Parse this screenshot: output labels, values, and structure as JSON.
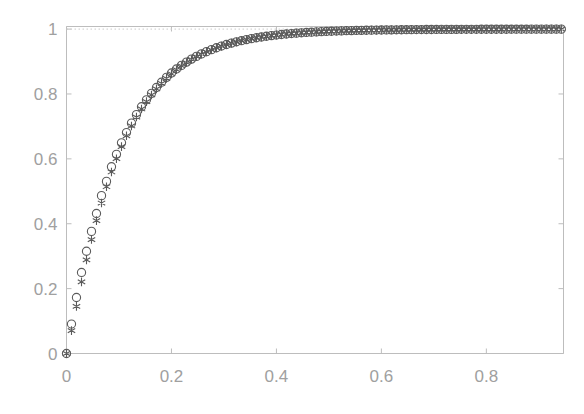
{
  "figure": {
    "background_color": "#ffffff",
    "axis_color": "#bdbdbd",
    "tick_label_color": "#a0a0a0",
    "marker_color": "#5a5a5a",
    "reference_line_color": "#cccccc"
  },
  "chart_data": {
    "type": "scatter",
    "title": "",
    "xlabel": "",
    "ylabel": "",
    "xlim": [
      0,
      0.947
    ],
    "ylim": [
      0,
      1.008
    ],
    "grid": false,
    "legend": "none",
    "xticks": [
      0,
      0.2,
      0.4,
      0.6,
      0.8
    ],
    "xtick_labels": [
      "0",
      "0.2",
      "0.4",
      "0.6",
      "0.8"
    ],
    "yticks": [
      0,
      0.2,
      0.4,
      0.6,
      0.8,
      1
    ],
    "ytick_labels": [
      "0",
      "0.2",
      "0.4",
      "0.6",
      "0.8",
      "1"
    ],
    "annotations": [
      {
        "name": "asymptote-reference-line",
        "type": "hline",
        "y": 1.0,
        "style": "dotted",
        "color": "#cccccc"
      }
    ],
    "series": [
      {
        "name": "series-circle",
        "marker": "o",
        "color": "#5a5a5a",
        "x": [
          0,
          0.0095,
          0.019,
          0.0286,
          0.0381,
          0.0476,
          0.0571,
          0.0667,
          0.0762,
          0.0857,
          0.0952,
          0.1048,
          0.1143,
          0.1238,
          0.1333,
          0.1429,
          0.1524,
          0.1619,
          0.1714,
          0.181,
          0.1905,
          0.2,
          0.2095,
          0.219,
          0.2286,
          0.2381,
          0.2476,
          0.2571,
          0.2667,
          0.2762,
          0.2857,
          0.2952,
          0.3048,
          0.3143,
          0.3238,
          0.3333,
          0.3429,
          0.3524,
          0.3619,
          0.3714,
          0.381,
          0.3905,
          0.4,
          0.4095,
          0.419,
          0.4286,
          0.4381,
          0.4476,
          0.4571,
          0.4667,
          0.4762,
          0.4857,
          0.4952,
          0.5048,
          0.5143,
          0.5238,
          0.5333,
          0.5429,
          0.5524,
          0.5619,
          0.5714,
          0.581,
          0.5905,
          0.6,
          0.6095,
          0.619,
          0.6286,
          0.6381,
          0.6476,
          0.6571,
          0.6667,
          0.6762,
          0.6857,
          0.6952,
          0.7048,
          0.7143,
          0.7238,
          0.7333,
          0.7429,
          0.7524,
          0.7619,
          0.7714,
          0.781,
          0.7905,
          0.8,
          0.8095,
          0.819,
          0.8286,
          0.8381,
          0.8476,
          0.8571,
          0.8667,
          0.8762,
          0.8857,
          0.8952,
          0.9048,
          0.9143,
          0.9238,
          0.9333,
          0.9429
        ],
        "y": [
          0,
          0.0907,
          0.1727,
          0.2498,
          0.3152,
          0.3764,
          0.4316,
          0.4866,
          0.5305,
          0.5756,
          0.6141,
          0.6493,
          0.681,
          0.7101,
          0.7363,
          0.7607,
          0.7821,
          0.8019,
          0.8199,
          0.8363,
          0.8512,
          0.8647,
          0.8771,
          0.8881,
          0.8982,
          0.9075,
          0.9159,
          0.9236,
          0.9305,
          0.9367,
          0.9425,
          0.9478,
          0.9525,
          0.9568,
          0.9608,
          0.9643,
          0.9676,
          0.9706,
          0.9733,
          0.9757,
          0.9779,
          0.9799,
          0.9817,
          0.9834,
          0.9849,
          0.9862,
          0.9875,
          0.9886,
          0.9896,
          0.9905,
          0.9913,
          0.9921,
          0.9928,
          0.9934,
          0.994,
          0.9945,
          0.995,
          0.9954,
          0.9958,
          0.9961,
          0.9964,
          0.9967,
          0.997,
          0.9972,
          0.9975,
          0.9977,
          0.9979,
          0.998,
          0.9982,
          0.9983,
          0.9985,
          0.9986,
          0.9987,
          0.9988,
          0.9989,
          0.999,
          0.9991,
          0.9991,
          0.9992,
          0.9993,
          0.9993,
          0.9994,
          0.9994,
          0.9995,
          0.9995,
          0.9995,
          0.9996,
          0.9996,
          0.9996,
          0.9997,
          0.9997,
          0.9997,
          0.9997,
          0.9998,
          0.9998,
          0.9998,
          0.9998,
          0.9998,
          0.9998,
          0.9999
        ]
      },
      {
        "name": "series-asterisk",
        "marker": "*",
        "color": "#5a5a5a",
        "x": [
          0,
          0.0095,
          0.019,
          0.0286,
          0.0381,
          0.0476,
          0.0571,
          0.0667,
          0.0762,
          0.0857,
          0.0952,
          0.1048,
          0.1143,
          0.1238,
          0.1333,
          0.1429,
          0.1524,
          0.1619,
          0.1714,
          0.181,
          0.1905,
          0.2,
          0.2095,
          0.219,
          0.2286,
          0.2381,
          0.2476,
          0.2571,
          0.2667,
          0.2762,
          0.2857,
          0.2952,
          0.3048,
          0.3143,
          0.3238,
          0.3333,
          0.3429,
          0.3524,
          0.3619,
          0.3714,
          0.381,
          0.3905,
          0.4,
          0.4095,
          0.419,
          0.4286,
          0.4381,
          0.4476,
          0.4571,
          0.4667,
          0.4762,
          0.4857,
          0.4952,
          0.5048,
          0.5143,
          0.5238,
          0.5333,
          0.5429,
          0.5524,
          0.5619,
          0.5714,
          0.581,
          0.5905,
          0.6,
          0.6095,
          0.619,
          0.6286,
          0.6381,
          0.6476,
          0.6571,
          0.6667,
          0.6762,
          0.6857,
          0.6952,
          0.7048,
          0.7143,
          0.7238,
          0.7333,
          0.7429,
          0.7524,
          0.7619,
          0.7714,
          0.781,
          0.7905,
          0.8,
          0.8095,
          0.819,
          0.8286,
          0.8381,
          0.8476,
          0.8571,
          0.8667,
          0.8762,
          0.8857,
          0.8952,
          0.9048,
          0.9143,
          0.9238,
          0.9333,
          0.9429
        ],
        "y": [
          0,
          0.0704,
          0.1452,
          0.2208,
          0.2886,
          0.3512,
          0.4095,
          0.4639,
          0.5141,
          0.5596,
          0.6005,
          0.6376,
          0.6711,
          0.7014,
          0.7288,
          0.7538,
          0.7764,
          0.797,
          0.8157,
          0.8327,
          0.8481,
          0.8621,
          0.8749,
          0.8864,
          0.8968,
          0.9063,
          0.9149,
          0.9228,
          0.9299,
          0.9363,
          0.9422,
          0.9475,
          0.9523,
          0.9567,
          0.9607,
          0.9643,
          0.9676,
          0.9706,
          0.9733,
          0.9757,
          0.9779,
          0.9799,
          0.9817,
          0.9834,
          0.9849,
          0.9862,
          0.9875,
          0.9886,
          0.9896,
          0.9905,
          0.9913,
          0.9921,
          0.9927,
          0.9934,
          0.9939,
          0.9944,
          0.9949,
          0.9953,
          0.9957,
          0.9961,
          0.9964,
          0.9967,
          0.9969,
          0.9972,
          0.9974,
          0.9976,
          0.9978,
          0.998,
          0.9981,
          0.9983,
          0.9984,
          0.9985,
          0.9986,
          0.9987,
          0.9988,
          0.9989,
          0.999,
          0.9991,
          0.9991,
          0.9992,
          0.9992,
          0.9993,
          0.9993,
          0.9994,
          0.9994,
          0.9995,
          0.9995,
          0.9995,
          0.9996,
          0.9996,
          0.9996,
          0.9997,
          0.9997,
          0.9997,
          0.9997,
          0.9997,
          0.9998,
          0.9998,
          0.9998,
          0.9998
        ]
      }
    ]
  }
}
